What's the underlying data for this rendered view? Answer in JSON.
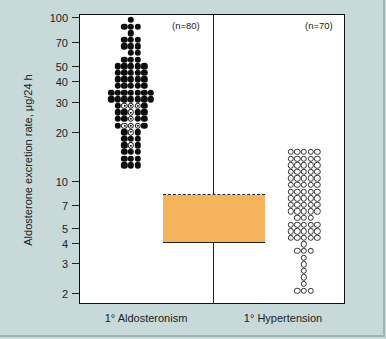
{
  "chart_data": {
    "type": "scatter",
    "subtype": "dot-strip-plot",
    "title": "",
    "ylabel": "Aldosterone excretion rate, μg/24 h",
    "xlabel": "",
    "yscale": "log",
    "ylim": [
      1.7,
      110
    ],
    "yticks": [
      2,
      3,
      4,
      5,
      7,
      10,
      20,
      30,
      40,
      50,
      70,
      100
    ],
    "categories": [
      "1° Aldosteronism",
      "1° Hypertension"
    ],
    "series": [
      {
        "name": "1° Aldosteronism",
        "n": 80,
        "n_label": "(n=80)",
        "marker": "filled circle (some open circles with center dot)",
        "approx_range": [
          13,
          100
        ],
        "approx_median": 30
      },
      {
        "name": "1° Hypertension",
        "n": 70,
        "n_label": "(n=70)",
        "marker": "open circle",
        "approx_range": [
          2.3,
          15
        ],
        "approx_median": 7
      }
    ],
    "reference_band": {
      "label": "normal range",
      "low": 4,
      "high": 8,
      "color": "#f6b35e",
      "top_line": "dashed",
      "bottom_line": "solid"
    },
    "grid": false,
    "legend": "none"
  },
  "axis": {
    "ylabel": "Aldosterone excretion rate, μg/24 h",
    "ticks": [
      {
        "label": "100",
        "y": 17
      },
      {
        "label": "70",
        "y": 42
      },
      {
        "label": "50",
        "y": 66
      },
      {
        "label": "40",
        "y": 81
      },
      {
        "label": "30",
        "y": 102
      },
      {
        "label": "20",
        "y": 132
      },
      {
        "label": "10",
        "y": 181
      },
      {
        "label": "7",
        "y": 205
      },
      {
        "label": "5",
        "y": 228
      },
      {
        "label": "4",
        "y": 243
      },
      {
        "label": "3",
        "y": 263
      },
      {
        "label": "2",
        "y": 293
      }
    ]
  },
  "groups": [
    {
      "label": "1° Aldosteronism",
      "n_label": "(n=80)"
    },
    {
      "label": "1° Hypertension",
      "n_label": "(n=70)"
    }
  ],
  "colors": {
    "background": "#c8d9d9",
    "plot": "#ffffff",
    "band": "#f6b35e",
    "ink": "#111111"
  }
}
